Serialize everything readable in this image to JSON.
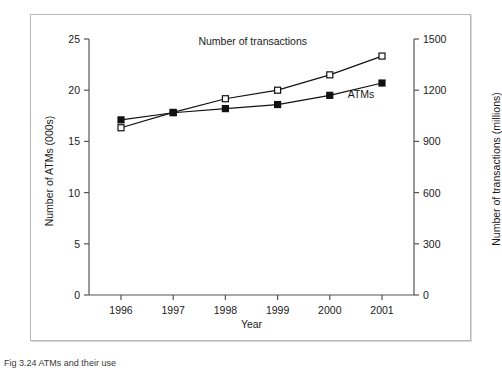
{
  "figure": {
    "caption": "Fig 3.24 ATMs and their use"
  },
  "chart_data": {
    "type": "line",
    "title": "",
    "xlabel": "Year",
    "ylabel": "Number of ATMs (000s)",
    "y2label": "Number of transactions (millions)",
    "categories": [
      "1996",
      "1997",
      "1998",
      "1999",
      "2000",
      "2001"
    ],
    "x": [
      1996,
      1997,
      1998,
      1999,
      2000,
      2001
    ],
    "ylim": [
      0,
      25
    ],
    "y2lim": [
      0,
      1500
    ],
    "yticks": [
      "0",
      "5",
      "10",
      "15",
      "20",
      "25"
    ],
    "ytick_values": [
      0,
      5,
      10,
      15,
      20,
      25
    ],
    "y2ticks": [
      "0",
      "300",
      "600",
      "900",
      "1200",
      "1500"
    ],
    "y2tick_values": [
      0,
      300,
      600,
      900,
      1200,
      1500
    ],
    "grid": false,
    "legend": "inline-annotations",
    "series": [
      {
        "name": "ATMs",
        "axis": "left",
        "marker": "filled-square",
        "color": "#111111",
        "values": [
          17.1,
          17.8,
          18.2,
          18.6,
          19.5,
          20.7
        ]
      },
      {
        "name": "Number of transactions",
        "axis": "right",
        "marker": "open-square",
        "color": "#111111",
        "values": [
          980,
          1070,
          1150,
          1200,
          1290,
          1400
        ]
      }
    ],
    "annotations": [
      {
        "text": "Number of transactions",
        "x": 1998.6,
        "series": "transactions"
      },
      {
        "text": "ATMs",
        "x": 2000.1,
        "series": "atms"
      }
    ]
  }
}
